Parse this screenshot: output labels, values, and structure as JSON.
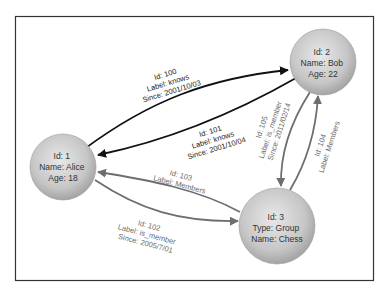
{
  "nodes": [
    {
      "id": "1",
      "lines": [
        "Id: 1",
        "Name: Alice",
        "Age: 18"
      ]
    },
    {
      "id": "2",
      "lines": [
        "Id: 2",
        "Name: Bob",
        "Age: 22"
      ]
    },
    {
      "id": "3",
      "lines": [
        "Id: 3",
        "Type: Group",
        "Name: Chess"
      ]
    }
  ],
  "edges": [
    {
      "id": "100",
      "from": "1",
      "to": "2",
      "lines": [
        "Id: 100",
        "Label: knows",
        "Since: 2001/10/03"
      ],
      "color": "#111111"
    },
    {
      "id": "101",
      "from": "2",
      "to": "1",
      "lines": [
        "Id: 101",
        "Label: knows",
        "Since: 2001/10/04"
      ],
      "color": "#111111"
    },
    {
      "id": "102",
      "from": "1",
      "to": "3",
      "lines": [
        "Id: 102",
        "Label: is_member",
        "Since: 2005/7/01"
      ],
      "color": "#6e6e6e"
    },
    {
      "id": "103",
      "from": "3",
      "to": "1",
      "lines": [
        "Id: 103",
        "Label: Members"
      ],
      "color": "#6e6e6e"
    },
    {
      "id": "104",
      "from": "3",
      "to": "2",
      "lines": [
        "Id: 104",
        "Label: Members"
      ],
      "color": "#6e6e6e"
    },
    {
      "id": "105",
      "from": "2",
      "to": "3",
      "lines": [
        "Id: 105",
        "Label: is_member",
        "Since: 2011/02/14"
      ],
      "color": "#6e6e6e"
    }
  ],
  "colors": {
    "frame": "#333333",
    "node_light": "#e6e6e6",
    "node_dark": "#a8a8a8",
    "edge_dark": "#111111",
    "edge_gray": "#6e6e6e"
  }
}
